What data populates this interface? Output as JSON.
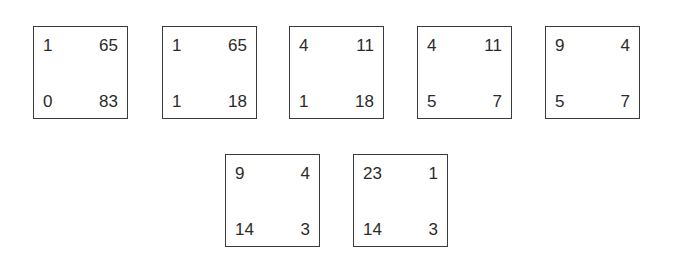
{
  "matrices": [
    {
      "tl": "1",
      "tr": "65",
      "bl": "0",
      "br": "83"
    },
    {
      "tl": "1",
      "tr": "65",
      "bl": "1",
      "br": "18"
    },
    {
      "tl": "4",
      "tr": "11",
      "bl": "1",
      "br": "18"
    },
    {
      "tl": "4",
      "tr": "11",
      "bl": "5",
      "br": "7"
    },
    {
      "tl": "9",
      "tr": "4",
      "bl": "5",
      "br": "7"
    },
    {
      "tl": "9",
      "tr": "4",
      "bl": "14",
      "br": "3"
    },
    {
      "tl": "23",
      "tr": "1",
      "bl": "14",
      "br": "3"
    }
  ]
}
